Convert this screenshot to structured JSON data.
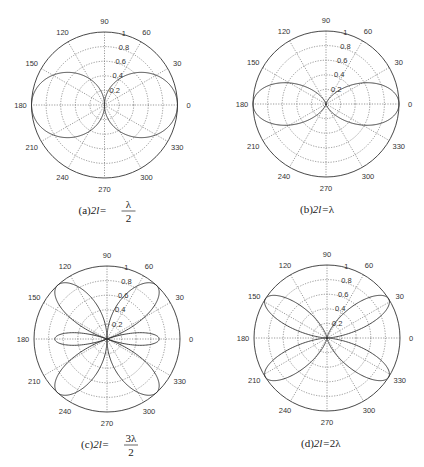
{
  "figure": {
    "background": "#ffffff",
    "line_color": "#333333",
    "grid_color": "#555555"
  },
  "chart_data": [
    {
      "type": "polar",
      "id": "a",
      "caption_prefix": "(a)",
      "caption_lhs": "2l=",
      "caption_num": "λ",
      "caption_den": "2",
      "length_over_lambda": 0.5,
      "center": [
        104.5,
        105
      ],
      "radius": 73,
      "angle_ticks": [
        0,
        30,
        60,
        90,
        120,
        150,
        180,
        210,
        240,
        270,
        300,
        330
      ],
      "radial_ticks": [
        "0.2",
        "0.4",
        "0.6",
        "0.8",
        "1"
      ],
      "rlim": [
        0,
        1
      ],
      "grid": true,
      "description": "Normalized E-plane radiation pattern of symmetric dipole, 2l = λ/2 (two broad lobes at 0° and 180°)"
    },
    {
      "type": "polar",
      "id": "b",
      "caption_prefix": "(b)",
      "caption_lhs": "2l=",
      "caption_num": "λ",
      "caption_den": "",
      "length_over_lambda": 1.0,
      "center": [
        326,
        104
      ],
      "radius": 73,
      "angle_ticks": [
        0,
        30,
        60,
        90,
        120,
        150,
        180,
        210,
        240,
        270,
        300,
        330
      ],
      "radial_ticks": [
        "0.2",
        "0.4",
        "0.6",
        "0.8",
        "1"
      ],
      "rlim": [
        0,
        1
      ],
      "grid": true,
      "description": "Normalized pattern, 2l = λ (narrower figure-eight lobes at 0° and 180°)"
    },
    {
      "type": "polar",
      "id": "c",
      "caption_prefix": "(c)",
      "caption_lhs": "2l=",
      "caption_num": "3λ",
      "caption_den": "2",
      "length_over_lambda": 1.5,
      "center": [
        107,
        339
      ],
      "radius": 73,
      "angle_ticks": [
        0,
        30,
        60,
        90,
        120,
        150,
        180,
        210,
        240,
        270,
        300,
        330
      ],
      "radial_ticks": [
        "0.2",
        "0.4",
        "0.6",
        "0.8",
        "1"
      ],
      "rlim": [
        0,
        1
      ],
      "grid": true,
      "description": "Normalized pattern, 2l = 3λ/2 (main lobes near ±42°, ±138°, minor lobes at 0°/180°)"
    },
    {
      "type": "polar",
      "id": "d",
      "caption_prefix": "(d)",
      "caption_lhs": "2l=",
      "caption_num": "2λ",
      "caption_den": "",
      "length_over_lambda": 2.0,
      "center": [
        327,
        338
      ],
      "radius": 73,
      "angle_ticks": [
        0,
        30,
        60,
        90,
        120,
        150,
        180,
        210,
        240,
        270,
        300,
        330
      ],
      "radial_ticks": [
        "0.2",
        "0.4",
        "0.6",
        "0.8",
        "1"
      ],
      "rlim": [
        0,
        1
      ],
      "grid": true,
      "description": "Normalized pattern, 2l = 2λ (four lobes near 30°, 150°, 210°, 330°)"
    }
  ]
}
